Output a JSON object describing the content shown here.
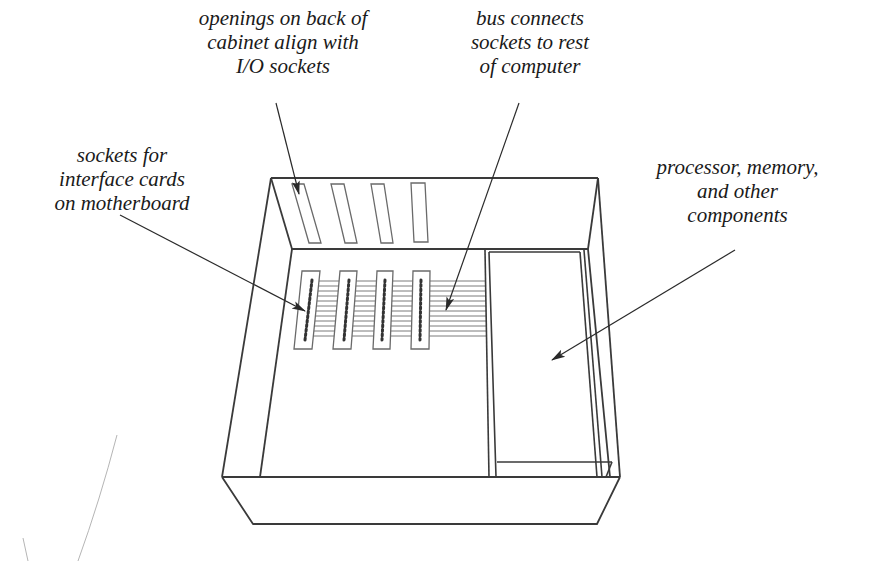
{
  "figure": {
    "colors": {
      "background": "#ffffff",
      "line": "#3a3a3a",
      "text": "#1a1a1a",
      "thin_line": "#6a6a6a"
    }
  },
  "labels": {
    "openings": {
      "lines": [
        "openings on back of",
        "cabinet align with",
        "I/O sockets"
      ]
    },
    "bus": {
      "lines": [
        "bus connects",
        "sockets to rest",
        "of computer"
      ]
    },
    "sockets": {
      "lines": [
        "sockets for",
        "interface cards",
        "on motherboard"
      ]
    },
    "processor": {
      "lines": [
        "processor, memory,",
        "and other",
        "components"
      ]
    }
  },
  "elements": {
    "back_openings_count": 4,
    "card_sockets_count": 4,
    "bus_lines_count": 12
  }
}
